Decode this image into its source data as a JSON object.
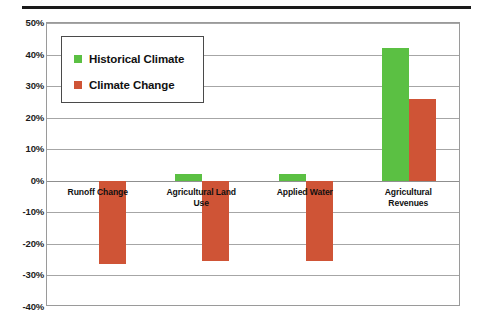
{
  "chart_data": {
    "type": "bar",
    "title": "",
    "xlabel": "",
    "ylabel": "",
    "ylim": [
      -40,
      50
    ],
    "grid": true,
    "legend_position": "top-left-inside",
    "ytick_labels": [
      "50%",
      "40%",
      "30%",
      "20%",
      "10%",
      "0%",
      "-10%",
      "-20%",
      "-30%",
      "-40%"
    ],
    "ytick_values": [
      50,
      40,
      30,
      20,
      10,
      0,
      -10,
      -20,
      -30,
      -40
    ],
    "categories": [
      "Runoff Change",
      "Agricultural Land Use",
      "Applied Water",
      "Agricultural Revenues"
    ],
    "category_lines": [
      [
        "Runoff Change"
      ],
      [
        "Agricultural Land",
        "Use"
      ],
      [
        "Applied Water"
      ],
      [
        "Agricultural",
        "Revenues"
      ]
    ],
    "series": [
      {
        "name": "Historical Climate",
        "color": "#5bc043",
        "values": [
          0,
          2,
          2,
          42
        ]
      },
      {
        "name": "Climate Change",
        "color": "#cf5436",
        "values": [
          -26.5,
          -25.5,
          -25.5,
          26
        ]
      }
    ]
  },
  "legend": {
    "items": [
      {
        "label": "Historical Climate",
        "color": "#5bc043",
        "swatch": "green-square"
      },
      {
        "label": "Climate Change",
        "color": "#cf5436",
        "swatch": "orange-square"
      }
    ]
  }
}
